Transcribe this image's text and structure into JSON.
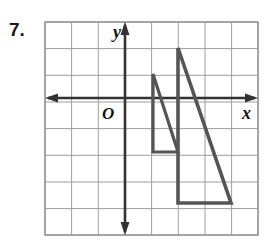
{
  "problem": {
    "number": "7."
  },
  "figure": {
    "name": "coordinate-plane-two-triangles",
    "axis_labels": {
      "x": "x",
      "y": "y",
      "origin": "O"
    },
    "colors": {
      "grid_line": "#9a9a9a",
      "grid_border": "#8f8f8f",
      "axis": "#333333",
      "shape_stroke": "#555555",
      "text": "#1a1a1a",
      "background": "#ffffff"
    },
    "grid": {
      "columns": 8,
      "rows": 8,
      "cell_px": 26.6,
      "left_px": 5,
      "top_px": 6,
      "width_px": 213,
      "height_px": 213,
      "show_gridlines": true
    },
    "axes": {
      "origin_px": {
        "x": 85,
        "y": 82
      },
      "x_axis": {
        "y_px": 82,
        "x_start_px": 5,
        "x_end_px": 218,
        "arrows": "both"
      },
      "y_axis": {
        "x_px": 85,
        "y_start_px": 6,
        "y_end_px": 219,
        "arrows": "both"
      }
    },
    "shapes": [
      {
        "name": "small-triangle",
        "stroke_width": 3.2,
        "fill": "none",
        "vertices_px": [
          {
            "x": 113,
            "y": 58
          },
          {
            "x": 113,
            "y": 136
          },
          {
            "x": 138,
            "y": 136
          }
        ],
        "vertices_units": [
          {
            "x": 1,
            "y": 1
          },
          {
            "x": 1,
            "y": -2
          },
          {
            "x": 2,
            "y": -2
          }
        ]
      },
      {
        "name": "large-triangle",
        "stroke_width": 3.6,
        "fill": "none",
        "vertices_px": [
          {
            "x": 138,
            "y": 32
          },
          {
            "x": 138,
            "y": 187
          },
          {
            "x": 191,
            "y": 187
          }
        ],
        "vertices_units": [
          {
            "x": 2,
            "y": 2
          },
          {
            "x": 2,
            "y": -4
          },
          {
            "x": 4,
            "y": -4
          }
        ]
      }
    ]
  }
}
